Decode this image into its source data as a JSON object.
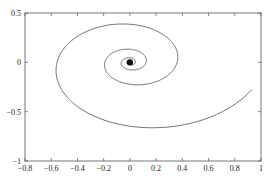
{
  "chart_data": {
    "type": "line",
    "title": "",
    "xlabel": "",
    "ylabel": "",
    "xlim": [
      -0.8,
      1.0
    ],
    "ylim": [
      -1.0,
      0.5
    ],
    "grid": false,
    "legend": null,
    "x_ticks": [
      -0.8,
      -0.6,
      -0.4,
      -0.2,
      0,
      0.2,
      0.4,
      0.6,
      0.8,
      1
    ],
    "x_tick_labels": [
      "-0.8",
      "-0.6",
      "-0.4",
      "-0.2",
      "0",
      "0.2",
      "0.4",
      "0.6",
      "0.8",
      "1"
    ],
    "y_ticks": [
      -1,
      -0.5,
      0,
      0.5
    ],
    "y_tick_labels": [
      "-1",
      "-0.5",
      "0",
      "0.5"
    ],
    "series": [
      {
        "name": "spiral trajectory",
        "description": "Clockwise inward spiral converging to origin (0,0)",
        "start_point": [
          0.95,
          -0.27
        ],
        "key_points": [
          [
            0.95,
            -0.27
          ],
          [
            0.12,
            -0.86
          ],
          [
            -0.68,
            -0.1
          ],
          [
            0.0,
            0.49
          ],
          [
            0.35,
            0.1
          ],
          [
            0.1,
            -0.2
          ],
          [
            -0.2,
            -0.02
          ],
          [
            0.0,
            0.08
          ],
          [
            0.0,
            0.0
          ]
        ],
        "end_point": [
          0.0,
          0.0
        ],
        "color": "#333333"
      }
    ]
  },
  "style": {
    "axis_color": "#555555",
    "line_color": "#333333"
  }
}
